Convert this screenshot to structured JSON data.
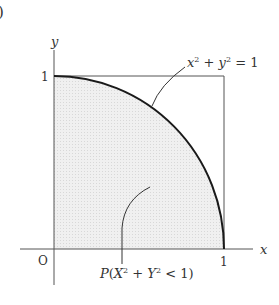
{
  "figure": {
    "marker": ")",
    "axes": {
      "x_label": "x",
      "y_label": "y",
      "origin_label": "O",
      "x_tick": "1",
      "y_tick": "1"
    },
    "curve_label": {
      "lhs_x": "x",
      "exp": "2",
      "plus": " + ",
      "lhs_y": "y",
      "eq": " = 1"
    },
    "region_label": {
      "P": "P",
      "open": "(",
      "X": "X",
      "exp": "2",
      "plus": " + ",
      "Y": "Y",
      "lt": " < 1)"
    },
    "colors": {
      "fill": "#ececec",
      "curve": "#1a1a1a",
      "axis": "#555555",
      "square": "#555555"
    }
  }
}
